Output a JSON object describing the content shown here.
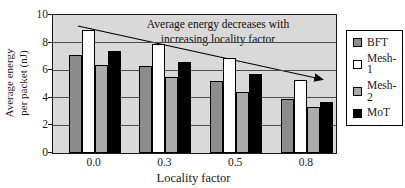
{
  "chart_data": {
    "type": "bar",
    "title": "",
    "xlabel": "Locality factor",
    "ylabel": "Average energy per packet (nJ)",
    "ylabel_line1": "Average energy",
    "ylabel_line2": "per packet (nJ)",
    "categories": [
      "0.0",
      "0.3",
      "0.5",
      "0.8"
    ],
    "series": [
      {
        "name": "BFT",
        "color": "#8c8c8c",
        "values": [
          7.1,
          6.3,
          5.2,
          3.9
        ]
      },
      {
        "name": "Mesh-1",
        "color": "#ffffff",
        "values": [
          8.9,
          7.9,
          6.9,
          5.3
        ]
      },
      {
        "name": "Mesh-2",
        "color": "#ababab",
        "values": [
          6.4,
          5.5,
          4.4,
          3.3
        ]
      },
      {
        "name": "MoT",
        "color": "#000000",
        "values": [
          7.4,
          6.6,
          5.7,
          3.7
        ]
      }
    ],
    "ylim": [
      0,
      10
    ],
    "ytick_step": 2,
    "yticks": [
      "0",
      "2",
      "4",
      "6",
      "8",
      "10"
    ],
    "grid": true,
    "legend_position": "right",
    "plot_bg": "#d9d9d9",
    "bar_border": "#000000",
    "annotation": {
      "text_line1": "Average energy decreases with",
      "text_line2": "increasing locality factor",
      "arrow": {
        "x1": 0.088,
        "y1": 0.08,
        "x2": 0.95,
        "y2": 0.465
      }
    }
  }
}
